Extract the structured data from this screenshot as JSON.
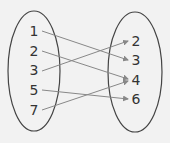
{
  "diagram": {
    "type": "mapping-diagram",
    "domain": [
      {
        "label": "1",
        "x": 34,
        "y": 36
      },
      {
        "label": "2",
        "x": 34,
        "y": 56
      },
      {
        "label": "3",
        "x": 34,
        "y": 75
      },
      {
        "label": "5",
        "x": 34,
        "y": 95
      },
      {
        "label": "7",
        "x": 34,
        "y": 115
      }
    ],
    "range": [
      {
        "label": "2",
        "x": 136,
        "y": 46
      },
      {
        "label": "3",
        "x": 136,
        "y": 65
      },
      {
        "label": "4",
        "x": 136,
        "y": 85
      },
      {
        "label": "6",
        "x": 136,
        "y": 104
      }
    ],
    "arrows": [
      {
        "from": "1",
        "to": "3",
        "x1": 42,
        "y1": 31,
        "x2": 128,
        "y2": 60
      },
      {
        "from": "2",
        "to": "4",
        "x1": 42,
        "y1": 51,
        "x2": 128,
        "y2": 79
      },
      {
        "from": "3",
        "to": "2",
        "x1": 42,
        "y1": 71,
        "x2": 128,
        "y2": 41
      },
      {
        "from": "5",
        "to": "6",
        "x1": 42,
        "y1": 90,
        "x2": 128,
        "y2": 99
      },
      {
        "from": "7",
        "to": "4",
        "x1": 42,
        "y1": 110,
        "x2": 128,
        "y2": 81
      }
    ],
    "colors": {
      "ellipse": "#444444",
      "arrow": "#888888",
      "text": "#333333",
      "background": "#f2f2f2"
    }
  }
}
